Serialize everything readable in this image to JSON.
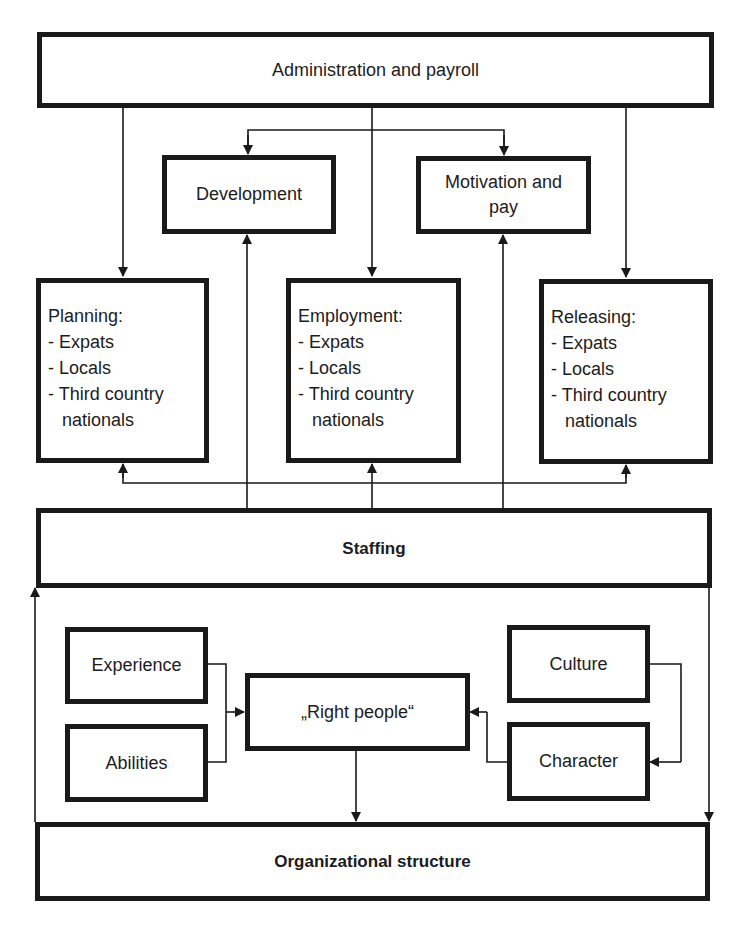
{
  "diagram": {
    "top": {
      "label": "Administration and payroll"
    },
    "middle_row": [
      {
        "id": "development",
        "label": "Development"
      },
      {
        "id": "motivation",
        "lines": [
          "Motivation and",
          "pay"
        ]
      }
    ],
    "process_boxes": [
      {
        "id": "planning",
        "title": "Planning:",
        "items": [
          "- Expats",
          "- Locals",
          "- Third country",
          "nationals"
        ]
      },
      {
        "id": "employment",
        "title": "Employment:",
        "items": [
          "- Expats",
          "- Locals",
          "- Third country",
          "nationals"
        ]
      },
      {
        "id": "releasing",
        "title": "Releasing:",
        "items": [
          "- Expats",
          "- Locals",
          "- Third country",
          "nationals"
        ]
      }
    ],
    "staffing": {
      "label": "Staffing"
    },
    "factors_left": [
      {
        "id": "experience",
        "label": "Experience"
      },
      {
        "id": "abilities",
        "label": "Abilities"
      }
    ],
    "center": {
      "label": "„Right people“"
    },
    "factors_right": [
      {
        "id": "culture",
        "label": "Culture"
      },
      {
        "id": "character",
        "label": "Character"
      }
    ],
    "bottom": {
      "label": "Organizational structure"
    }
  },
  "colors": {
    "stroke": "#1a1a1a",
    "background": "#ffffff",
    "text": "#1c1c1c"
  }
}
